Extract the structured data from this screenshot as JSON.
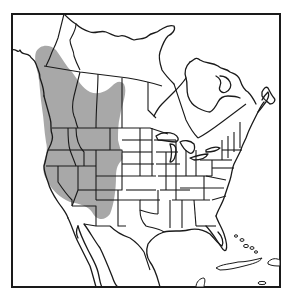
{
  "map": {
    "type": "species-range-map",
    "region": "North America",
    "colors": {
      "background": "#ffffff",
      "outline": "#1a1a1a",
      "range_fill": "#a8a8a8"
    },
    "legend": {
      "range_label": "Shaded area: species range"
    },
    "range_extent": {
      "description": "Western North America: southeast Alaska and British Columbia, Alberta and Saskatchewan south through Washington, Oregon, Idaho, Montana, Wyoming, Nevada, Utah, Colorado, Arizona and New Mexico"
    },
    "features": [
      "frame-border",
      "range-shading",
      "coastlines",
      "state-borders",
      "province-borders",
      "hudson-bay",
      "great-lakes",
      "caribbean-islands"
    ]
  }
}
